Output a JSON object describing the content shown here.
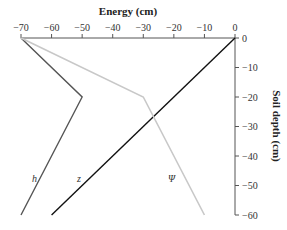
{
  "chart_data": {
    "type": "line",
    "title": "Energy (cm)",
    "xlabel": "Energy (cm)",
    "ylabel": "Soil depth (cm)",
    "xlim": [
      -70,
      0
    ],
    "ylim": [
      -60,
      0
    ],
    "x_ticks": [
      "-70",
      "-60",
      "-50",
      "-40",
      "-30",
      "-20",
      "-10",
      "0"
    ],
    "y_ticks": [
      "0",
      "-10",
      "-20",
      "-30",
      "-40",
      "-50",
      "-60"
    ],
    "grid": false,
    "legend": "inline labels",
    "series": [
      {
        "name": "h",
        "color": "#555555",
        "points": [
          [
            -70,
            0
          ],
          [
            -50,
            -20
          ],
          [
            -70,
            -60
          ]
        ]
      },
      {
        "name": "z",
        "color": "#111111",
        "points": [
          [
            0,
            0
          ],
          [
            -60,
            -60
          ]
        ]
      },
      {
        "name": "Ψ",
        "color": "#c8c8c8",
        "points": [
          [
            -70,
            0
          ],
          [
            -30,
            -20
          ],
          [
            -10,
            -60
          ]
        ]
      }
    ]
  },
  "labels": {
    "title": "Energy (cm)",
    "ylabel": "Soil depth (cm)",
    "h": "h",
    "z": "z",
    "psi": "Ψ"
  }
}
